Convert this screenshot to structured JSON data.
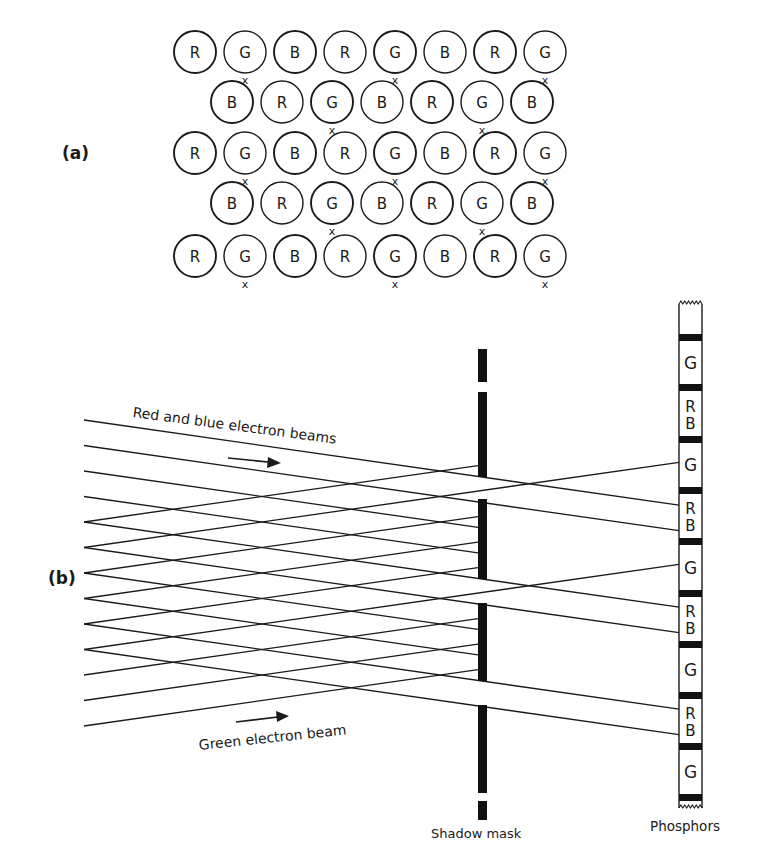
{
  "panel_a": {
    "label": "(a)",
    "dot_rows": [
      {
        "y": 52,
        "x_start": 195,
        "dots": [
          "R",
          "G",
          "B",
          "R",
          "G",
          "B",
          "R",
          "G"
        ],
        "marks": [
          1,
          4,
          7
        ]
      },
      {
        "y": 102,
        "x_start": 232,
        "dots": [
          "B",
          "R",
          "G",
          "B",
          "R",
          "G",
          "B"
        ],
        "marks": [
          2,
          5
        ]
      },
      {
        "y": 153,
        "x_start": 195,
        "dots": [
          "R",
          "G",
          "B",
          "R",
          "G",
          "B",
          "R",
          "G"
        ],
        "marks": [
          1,
          4,
          7
        ]
      },
      {
        "y": 203,
        "x_start": 232,
        "dots": [
          "B",
          "R",
          "G",
          "B",
          "R",
          "G",
          "B"
        ],
        "marks": [
          2,
          5
        ]
      },
      {
        "y": 256,
        "x_start": 195,
        "dots": [
          "R",
          "G",
          "B",
          "R",
          "G",
          "B",
          "R",
          "G"
        ],
        "marks": [
          1,
          4,
          7
        ]
      }
    ],
    "dot_pitch": 50,
    "dot_radius": 21,
    "mark_glyph": "x"
  },
  "panel_b": {
    "label": "(b)",
    "beam_label_top": "Red and blue electron beams",
    "beam_label_bottom": "Green electron beam",
    "shadow_mask_label": "Shadow mask",
    "phosphors_label": "Phosphors",
    "shadow_mask": {
      "x": 478,
      "width": 9,
      "segments": [
        [
          349,
          382
        ],
        [
          392,
          477
        ],
        [
          499,
          579
        ],
        [
          603,
          681
        ],
        [
          705,
          793
        ],
        [
          801,
          820
        ]
      ]
    },
    "phosphor_strip": {
      "x": 679,
      "width": 23,
      "top": 300,
      "bottom": 808,
      "bands": [
        334,
        384,
        436,
        487,
        538,
        590,
        641,
        692,
        743,
        794
      ],
      "band_height": 7,
      "labels": [
        "G",
        "RB",
        "G",
        "RB",
        "G",
        "RB",
        "G",
        "RB",
        "G"
      ]
    },
    "beam_left_x": 84,
    "beam_start_y": [
      420,
      445.5,
      471,
      496.5,
      522,
      547.5,
      573,
      598.5,
      624,
      649.5,
      675,
      700.5,
      726
    ],
    "red_blue_beam_rows": [
      0,
      1,
      2,
      3,
      4,
      5,
      6,
      7,
      8,
      9
    ],
    "green_beam_rows": [
      4,
      5,
      6,
      7,
      8,
      9,
      10,
      11,
      12
    ]
  }
}
